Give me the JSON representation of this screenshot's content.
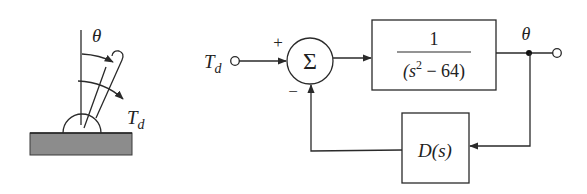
{
  "pendulum": {
    "angle_label": "θ",
    "torque_label_main": "T",
    "torque_label_sub": "d",
    "ground_color": "#8c8c8c"
  },
  "block_diagram": {
    "input_label_main": "T",
    "input_label_sub": "d",
    "sum_symbol": "Σ",
    "sum_plus_sign": "+",
    "sum_minus_sign": "−",
    "plant": {
      "numerator": "1",
      "denominator_open": "(s",
      "denominator_exp": "2",
      "denominator_rest": " − 64)"
    },
    "controller_label": "D(s)",
    "output_label": "θ"
  }
}
